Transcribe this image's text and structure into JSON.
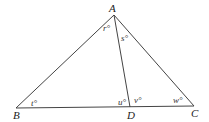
{
  "diagram": {
    "type": "geometry-triangle",
    "points": {
      "A": {
        "label": "A",
        "x": 114,
        "y": 15
      },
      "B": {
        "label": "B",
        "x": 16,
        "y": 108
      },
      "C": {
        "label": "C",
        "x": 194,
        "y": 106
      },
      "D": {
        "label": "D",
        "x": 130,
        "y": 107
      }
    },
    "segments": [
      {
        "from": "A",
        "to": "B"
      },
      {
        "from": "A",
        "to": "C"
      },
      {
        "from": "B",
        "to": "C"
      },
      {
        "from": "A",
        "to": "D"
      }
    ],
    "angles": {
      "r": {
        "label": "r°",
        "vertex": "A",
        "between": "AB-AD"
      },
      "s": {
        "label": "s°",
        "vertex": "A",
        "between": "AD-AC"
      },
      "t": {
        "label": "t°",
        "vertex": "B"
      },
      "u": {
        "label": "u°",
        "vertex": "D",
        "between": "DB-DA"
      },
      "v": {
        "label": "v°",
        "vertex": "D",
        "between": "DA-DC"
      },
      "w": {
        "label": "w°",
        "vertex": "C"
      }
    },
    "colors": {
      "line": "#444444",
      "text": "#222222",
      "background": "#ffffff"
    }
  }
}
